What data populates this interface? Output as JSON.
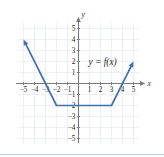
{
  "figure": {
    "kind": "coordinate-plane-graph",
    "function_label": "y = f(x)",
    "axis_labels": {
      "x": "x",
      "y": "y"
    },
    "colors": {
      "curve": "#3f6fb5",
      "axis": "#7a7a7a",
      "grid": "#e9eef2",
      "text": "#231f20",
      "footer_rule": "#b7cede"
    },
    "x_ticks": [
      {
        "value": -5,
        "label": "−5"
      },
      {
        "value": -4,
        "label": "−4"
      },
      {
        "value": -3,
        "label": "−3"
      },
      {
        "value": -2,
        "label": "−2"
      },
      {
        "value": -1,
        "label": "−1"
      },
      {
        "value": 1,
        "label": "1"
      },
      {
        "value": 2,
        "label": "2"
      },
      {
        "value": 3,
        "label": "3"
      },
      {
        "value": 4,
        "label": "4"
      },
      {
        "value": 5,
        "label": "5"
      }
    ],
    "y_ticks": [
      {
        "value": 5,
        "label": "5"
      },
      {
        "value": 4,
        "label": "4"
      },
      {
        "value": 3,
        "label": "3"
      },
      {
        "value": 2,
        "label": "2"
      },
      {
        "value": 1,
        "label": "1"
      },
      {
        "value": -1,
        "label": "−1"
      },
      {
        "value": -2,
        "label": "−2"
      },
      {
        "value": -3,
        "label": "−3"
      },
      {
        "value": -4,
        "label": "−4"
      },
      {
        "value": -5,
        "label": "−5"
      }
    ]
  },
  "chart_data": {
    "type": "line",
    "title": "",
    "xlabel": "x",
    "ylabel": "y",
    "xlim": [
      -5.6,
      5.6
    ],
    "ylim": [
      -5.6,
      5.6
    ],
    "grid": true,
    "legend": "none",
    "annotations": [
      {
        "text": "y = f(x)",
        "x": 2.0,
        "y": 2.0
      }
    ],
    "series": [
      {
        "name": "f(x)",
        "description": "Piecewise linear: decreasing ray from upper left to (-2,-2), horizontal segment from (-2,-2) to (3,-2), increasing ray from (3,-2) to upper right",
        "arrow_start": true,
        "arrow_end": true,
        "points": [
          {
            "x": -5.0,
            "y": 4.0
          },
          {
            "x": -2.0,
            "y": -2.0
          },
          {
            "x": 3.0,
            "y": -2.0
          },
          {
            "x": 5.0,
            "y": 2.0
          }
        ]
      }
    ],
    "x_ticks": [
      -5,
      -4,
      -3,
      -2,
      -1,
      1,
      2,
      3,
      4,
      5
    ],
    "y_ticks": [
      -5,
      -4,
      -3,
      -2,
      -1,
      1,
      2,
      3,
      4,
      5
    ]
  }
}
